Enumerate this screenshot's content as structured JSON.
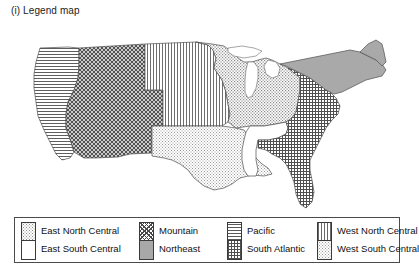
{
  "title": "(i) Legend map",
  "map": {
    "name": "united-states-census-divisions-map",
    "outline_color": "#555555",
    "background": "#ffffff"
  },
  "legend": {
    "border_color": "#4a4a4a",
    "columns": [
      {
        "entries": [
          {
            "label": "East North Central",
            "pattern": "gray-stipple",
            "pattern_class": "p-enc"
          },
          {
            "label": "East South Central",
            "pattern": "blank-white",
            "pattern_class": "p-esc"
          }
        ]
      },
      {
        "entries": [
          {
            "label": "Mountain",
            "pattern": "dark-diagonal-crosshatch",
            "pattern_class": "p-mtn"
          },
          {
            "label": "Northeast",
            "pattern": "solid-gray",
            "pattern_class": "p-ne"
          }
        ]
      },
      {
        "entries": [
          {
            "label": "Pacific",
            "pattern": "horizontal-lines",
            "pattern_class": "p-pac"
          },
          {
            "label": "South Atlantic",
            "pattern": "fine-grid",
            "pattern_class": "p-sa"
          }
        ]
      },
      {
        "entries": [
          {
            "label": "West North Central",
            "pattern": "vertical-lines",
            "pattern_class": "p-wnc"
          },
          {
            "label": "West South Central",
            "pattern": "light-stipple",
            "pattern_class": "p-wsc"
          }
        ]
      }
    ]
  },
  "regions": [
    {
      "name": "Pacific",
      "pattern_class": "p-pac"
    },
    {
      "name": "Mountain",
      "pattern_class": "p-mtn"
    },
    {
      "name": "West North Central",
      "pattern_class": "p-wnc"
    },
    {
      "name": "West South Central",
      "pattern_class": "p-wsc"
    },
    {
      "name": "East North Central",
      "pattern_class": "p-enc"
    },
    {
      "name": "East South Central",
      "pattern_class": "p-esc"
    },
    {
      "name": "South Atlantic",
      "pattern_class": "p-sa"
    },
    {
      "name": "Northeast",
      "pattern_class": "p-ne"
    }
  ]
}
